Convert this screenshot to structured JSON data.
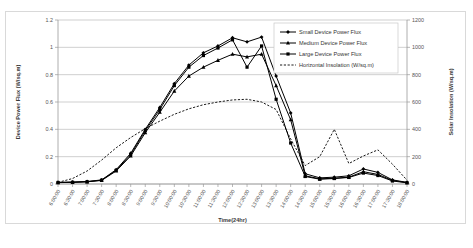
{
  "chart_data": {
    "type": "line",
    "title": "",
    "xlabel": "Time(24hr)",
    "ylabel": "Device Power Flux (W/sq.m)",
    "y2label": "Solar Insolation (W/sq.m)",
    "ylim": [
      0,
      1.2
    ],
    "y2lim": [
      0,
      1200
    ],
    "yticks": [
      "0",
      "0.2",
      "0.4",
      "0.6",
      "0.8",
      "1",
      "1.2"
    ],
    "ytick_values": [
      0,
      0.2,
      0.4,
      0.6,
      0.8,
      1,
      1.2
    ],
    "y2ticks": [
      "0",
      "200",
      "400",
      "600",
      "800",
      "1000",
      "1200"
    ],
    "y2tick_values": [
      0,
      200,
      400,
      600,
      800,
      1000,
      1200
    ],
    "grid": "horizontal",
    "legend_position": "inside-top-right",
    "categories": [
      "6:00:00",
      "6:30:00",
      "7:00:00",
      "7:30:00",
      "8:00:00",
      "8:30:00",
      "9:00:00",
      "9:30:00",
      "10:00:00",
      "10:30:00",
      "11:00:00",
      "11:30:00",
      "12:00:00",
      "12:30:00",
      "13:00:00",
      "13:30:00",
      "14:00:00",
      "14:30:00",
      "15:00:00",
      "15:30:00",
      "16:00:00",
      "16:30:00",
      "17:00:00",
      "17:30:00",
      "18:00:00"
    ],
    "series": [
      {
        "name": "Small Device Power Flux",
        "axis": "left",
        "marker": "diamond",
        "dash": "solid",
        "color": "#000000",
        "values": [
          0.012,
          0.014,
          0.018,
          0.03,
          0.105,
          0.225,
          0.4,
          0.56,
          0.735,
          0.87,
          0.96,
          1.01,
          1.07,
          1.04,
          1.075,
          0.79,
          0.52,
          0.075,
          0.045,
          0.05,
          0.06,
          0.11,
          0.085,
          0.03,
          0.012
        ]
      },
      {
        "name": "Medium Device Power Flux",
        "axis": "left",
        "marker": "triangle",
        "dash": "solid",
        "color": "#000000",
        "values": [
          0.01,
          0.012,
          0.016,
          0.026,
          0.095,
          0.205,
          0.375,
          0.525,
          0.68,
          0.79,
          0.855,
          0.905,
          0.95,
          0.93,
          0.95,
          0.72,
          0.47,
          0.06,
          0.038,
          0.042,
          0.05,
          0.09,
          0.07,
          0.026,
          0.01
        ]
      },
      {
        "name": "Large Device Power Flux",
        "axis": "left",
        "marker": "square",
        "dash": "solid",
        "color": "#000000",
        "values": [
          0.011,
          0.013,
          0.017,
          0.028,
          0.1,
          0.215,
          0.39,
          0.545,
          0.72,
          0.855,
          0.94,
          0.995,
          1.055,
          0.855,
          1.01,
          0.62,
          0.3,
          0.055,
          0.035,
          0.04,
          0.048,
          0.08,
          0.062,
          0.022,
          0.009
        ]
      },
      {
        "name": "Horizontal Insolation (W/sq.m)",
        "axis": "right",
        "marker": "none",
        "dash": "dashed",
        "color": "#000000",
        "values": [
          12,
          40,
          95,
          175,
          265,
          340,
          405,
          460,
          510,
          550,
          580,
          600,
          615,
          620,
          600,
          545,
          330,
          135,
          200,
          400,
          150,
          205,
          250,
          145,
          28
        ]
      }
    ]
  },
  "legend": {
    "items": [
      "Small Device Power Flux",
      "Medium Device Power Flux",
      "Large Device Power Flux",
      "Horizontal Insolation (W/sq.m)"
    ]
  }
}
